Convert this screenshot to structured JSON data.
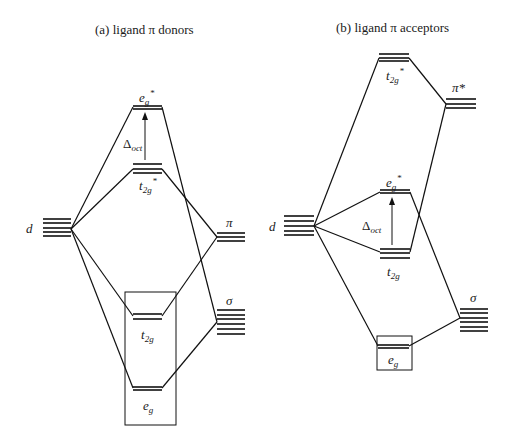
{
  "diagram": {
    "type": "molecular-orbital-diagram",
    "panels": [
      {
        "id": "a",
        "title": "(a)  ligand π donors",
        "labels": {
          "metal_d": "d",
          "eg_star": "e",
          "eg_star_sub": "g",
          "eg_star_sup": "*",
          "t2g_star": "t",
          "t2g_star_sub": "2g",
          "t2g_star_sup": "*",
          "delta": "Δ",
          "delta_sub": "oct",
          "ligand_pi": "π",
          "ligand_sigma": "σ",
          "t2g": "t",
          "t2g_sub": "2g",
          "eg": "e",
          "eg_sub": "g"
        }
      },
      {
        "id": "b",
        "title": "(b)  ligand π  acceptors",
        "labels": {
          "metal_d": "d",
          "t2g_star": "t",
          "t2g_star_sub": "2g",
          "t2g_star_sup": "*",
          "ligand_pi_star": "π*",
          "eg_star": "e",
          "eg_star_sub": "g",
          "eg_star_sup": "*",
          "delta": "Δ",
          "delta_sub": "oct",
          "t2g": "t",
          "t2g_sub": "2g",
          "ligand_sigma": "σ",
          "eg": "e",
          "eg_sub": "g"
        }
      }
    ],
    "colors": {
      "line": "#111111",
      "text": "#1a1a1a",
      "background": "#ffffff"
    }
  }
}
